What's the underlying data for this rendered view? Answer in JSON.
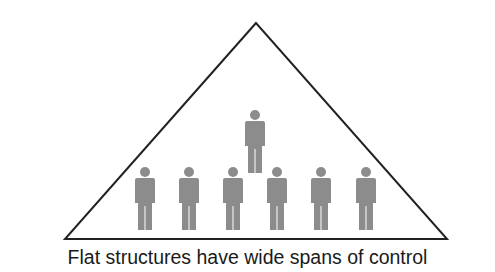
{
  "diagram": {
    "caption": "Flat structures have wide spans of control",
    "triangle": {
      "apex": [
        256,
        23
      ],
      "base_left": [
        65,
        239
      ],
      "base_right": [
        447,
        239
      ],
      "stroke": "#222222"
    },
    "figure_color": "#8c8c8c",
    "manager": {
      "x": 255,
      "y": 110
    },
    "subordinates": [
      {
        "x": 145,
        "y": 167
      },
      {
        "x": 189,
        "y": 167
      },
      {
        "x": 233,
        "y": 167
      },
      {
        "x": 277,
        "y": 167
      },
      {
        "x": 321,
        "y": 167
      },
      {
        "x": 366,
        "y": 167
      }
    ]
  }
}
